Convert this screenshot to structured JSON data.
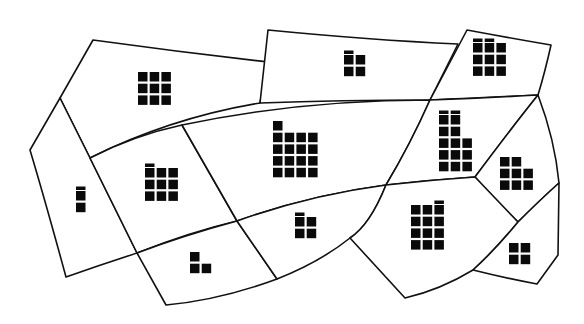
{
  "diagram": {
    "title": "",
    "colors": {
      "line": "#111111",
      "block": "#0a0a0a",
      "background": "#ffffff"
    },
    "zones": [
      {
        "id": "zone-north-west",
        "block_rows": [
          3,
          3,
          3
        ],
        "caps": []
      },
      {
        "id": "zone-north-center",
        "block_rows": [
          2,
          2
        ],
        "caps": [
          0
        ]
      },
      {
        "id": "zone-north-east",
        "block_rows": [
          3,
          3,
          3
        ],
        "caps": [
          0,
          1
        ]
      },
      {
        "id": "zone-west-edge",
        "block_rows": [
          1,
          1
        ],
        "caps": [
          0
        ]
      },
      {
        "id": "zone-west-center",
        "block_rows": [
          3,
          3,
          3
        ],
        "caps": [
          0
        ]
      },
      {
        "id": "zone-center",
        "block_rows": [
          1,
          4,
          4,
          4,
          4
        ],
        "caps": []
      },
      {
        "id": "zone-east-center",
        "block_rows": [
          2,
          2,
          3,
          3,
          3
        ],
        "caps": [
          0,
          1
        ]
      },
      {
        "id": "zone-east-small",
        "block_rows": [
          2,
          3,
          3
        ],
        "caps": []
      },
      {
        "id": "zone-south-west",
        "block_rows": [
          1,
          2
        ],
        "caps": []
      },
      {
        "id": "zone-south-center",
        "block_rows": [
          2,
          2
        ],
        "caps": [
          0
        ]
      },
      {
        "id": "zone-south-east",
        "block_rows": [
          3,
          3,
          3,
          3
        ],
        "caps": [
          2
        ]
      },
      {
        "id": "zone-far-south-east",
        "block_rows": [
          2,
          2
        ],
        "caps": []
      }
    ]
  }
}
